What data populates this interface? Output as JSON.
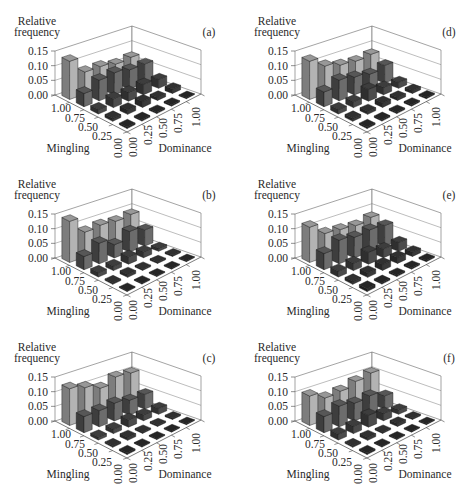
{
  "chart_data": [
    {
      "type": "bar",
      "subtype": "3d-bar",
      "panel_label": "(a)",
      "title": "",
      "zlabel": "Relative frequency",
      "zlabel_lines": [
        "Relative",
        "frequency"
      ],
      "ylabel": "Mingling",
      "xlabel": "Dominance",
      "mingling_ticks": [
        "1.00",
        "0.75",
        "0.50",
        "0.25",
        "0.00"
      ],
      "dominance_ticks": [
        "0.00",
        "0.25",
        "0.50",
        "0.75",
        "1.00"
      ],
      "z_ticks": [
        "0.00",
        "0.05",
        "0.10",
        "0.15"
      ],
      "zlim": [
        0,
        0.15
      ],
      "grid": true,
      "values_layout": "rows = mingling (1.00 to 0.00), columns = dominance (0.00 to 1.00)",
      "values": [
        [
          0.13,
          0.075,
          0.075,
          0.065,
          0.07
        ],
        [
          0.045,
          0.07,
          0.075,
          0.065,
          0.065
        ],
        [
          0.015,
          0.03,
          0.03,
          0.035,
          0.03
        ],
        [
          0.01,
          0.015,
          0.02,
          0.01,
          0.015
        ],
        [
          0.005,
          0.005,
          0.005,
          0.005,
          0.003
        ]
      ]
    },
    {
      "type": "bar",
      "subtype": "3d-bar",
      "panel_label": "(b)",
      "title": "",
      "zlabel": "Relative frequency",
      "zlabel_lines": [
        "Relative",
        "frequency"
      ],
      "ylabel": "Mingling",
      "xlabel": "Dominance",
      "mingling_ticks": [
        "1.00",
        "0.75",
        "0.50",
        "0.25",
        "0.00"
      ],
      "dominance_ticks": [
        "0.00",
        "0.25",
        "0.50",
        "0.75",
        "1.00"
      ],
      "z_ticks": [
        "0.00",
        "0.05",
        "0.10",
        "0.15"
      ],
      "zlim": [
        0,
        0.15
      ],
      "grid": true,
      "values_layout": "rows = mingling (1.00 to 0.00), columns = dominance (0.00 to 1.00)",
      "values": [
        [
          0.14,
          0.085,
          0.09,
          0.085,
          0.09
        ],
        [
          0.045,
          0.07,
          0.045,
          0.07,
          0.055
        ],
        [
          0.015,
          0.015,
          0.025,
          0.02,
          0.01
        ],
        [
          0.005,
          0.01,
          0.005,
          0.005,
          0.005
        ],
        [
          0.003,
          0.003,
          0.003,
          0.003,
          0.003
        ]
      ]
    },
    {
      "type": "bar",
      "subtype": "3d-bar",
      "panel_label": "(c)",
      "title": "",
      "zlabel": "Relative frequency",
      "zlabel_lines": [
        "Relative",
        "frequency"
      ],
      "ylabel": "Mingling",
      "xlabel": "Dominance",
      "mingling_ticks": [
        "1.00",
        "0.75",
        "0.50",
        "0.25",
        "0.00"
      ],
      "dominance_ticks": [
        "0.00",
        "0.25",
        "0.50",
        "0.75",
        "1.00"
      ],
      "z_ticks": [
        "0.00",
        "0.05",
        "0.10",
        "0.15"
      ],
      "zlim": [
        0,
        0.15
      ],
      "grid": true,
      "values_layout": "rows = mingling (1.00 to 0.00), columns = dominance (0.00 to 1.00)",
      "values": [
        [
          0.125,
          0.11,
          0.09,
          0.11,
          0.105
        ],
        [
          0.055,
          0.055,
          0.06,
          0.05,
          0.05
        ],
        [
          0.01,
          0.015,
          0.025,
          0.02,
          0.02
        ],
        [
          0.005,
          0.01,
          0.005,
          0.005,
          0.005
        ],
        [
          0.005,
          0.003,
          0.003,
          0.003,
          0.003
        ]
      ]
    },
    {
      "type": "bar",
      "subtype": "3d-bar",
      "panel_label": "(d)",
      "title": "",
      "zlabel": "Relative frequency",
      "zlabel_lines": [
        "Relative",
        "frequency"
      ],
      "ylabel": "Mingling",
      "xlabel": "Dominance",
      "mingling_ticks": [
        "1.00",
        "0.75",
        "0.50",
        "0.25",
        "0.00"
      ],
      "dominance_ticks": [
        "0.00",
        "0.25",
        "0.50",
        "0.75",
        "1.00"
      ],
      "z_ticks": [
        "0.00",
        "0.05",
        "0.10",
        "0.15"
      ],
      "zlim": [
        0,
        0.15
      ],
      "grid": true,
      "values_layout": "rows = mingling (1.00 to 0.00), columns = dominance (0.00 to 1.00)",
      "values": [
        [
          0.13,
          0.095,
          0.08,
          0.075,
          0.08
        ],
        [
          0.05,
          0.07,
          0.06,
          0.05,
          0.06
        ],
        [
          0.015,
          0.02,
          0.04,
          0.025,
          0.02
        ],
        [
          0.01,
          0.01,
          0.015,
          0.01,
          0.01
        ],
        [
          0.005,
          0.005,
          0.005,
          0.005,
          0.005
        ]
      ]
    },
    {
      "type": "bar",
      "subtype": "3d-bar",
      "panel_label": "(e)",
      "title": "",
      "zlabel": "Relative frequency",
      "zlabel_lines": [
        "Relative",
        "frequency"
      ],
      "ylabel": "Mingling",
      "xlabel": "Dominance",
      "mingling_ticks": [
        "1.00",
        "0.75",
        "0.50",
        "0.25",
        "0.00"
      ],
      "dominance_ticks": [
        "0.00",
        "0.25",
        "0.50",
        "0.75",
        "1.00"
      ],
      "z_ticks": [
        "0.00",
        "0.05",
        "0.10",
        "0.15"
      ],
      "zlim": [
        0,
        0.15
      ],
      "grid": true,
      "values_layout": "rows = mingling (1.00 to 0.00), columns = dominance (0.00 to 1.00)",
      "values": [
        [
          0.12,
          0.08,
          0.075,
          0.07,
          0.08
        ],
        [
          0.055,
          0.08,
          0.07,
          0.075,
          0.07
        ],
        [
          0.02,
          0.025,
          0.04,
          0.03,
          0.03
        ],
        [
          0.01,
          0.015,
          0.02,
          0.02,
          0.015
        ],
        [
          0.01,
          0.005,
          0.005,
          0.005,
          0.005
        ]
      ]
    },
    {
      "type": "bar",
      "subtype": "3d-bar",
      "panel_label": "(f)",
      "title": "",
      "zlabel": "Relative frequency",
      "zlabel_lines": [
        "Relative",
        "frequency"
      ],
      "ylabel": "Mingling",
      "xlabel": "Dominance",
      "mingling_ticks": [
        "1.00",
        "0.75",
        "0.50",
        "0.25",
        "0.00"
      ],
      "dominance_ticks": [
        "0.00",
        "0.25",
        "0.50",
        "0.75",
        "1.00"
      ],
      "z_ticks": [
        "0.00",
        "0.05",
        "0.10",
        "0.15"
      ],
      "zlim": [
        0,
        0.15
      ],
      "grid": true,
      "values_layout": "rows = mingling (1.00 to 0.00), columns = dominance (0.00 to 1.00)",
      "values": [
        [
          0.1,
          0.075,
          0.08,
          0.095,
          0.105
        ],
        [
          0.055,
          0.07,
          0.06,
          0.065,
          0.045
        ],
        [
          0.02,
          0.025,
          0.04,
          0.025,
          0.015
        ],
        [
          0.005,
          0.01,
          0.005,
          0.01,
          0.005
        ],
        [
          0.005,
          0.003,
          0.003,
          0.003,
          0.003
        ]
      ]
    }
  ]
}
